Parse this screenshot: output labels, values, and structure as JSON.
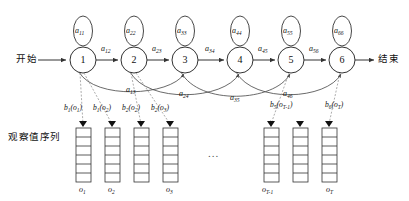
{
  "diagram": {
    "title_present": false,
    "start_label": "开始",
    "end_label": "结束",
    "observation_row_label": "观察值序列",
    "ellipsis": "...",
    "colors": {
      "stroke": "#333333",
      "dashed_stroke": "#8a8a8a",
      "text": "#111111",
      "background": "#ffffff"
    },
    "states": [
      {
        "id": "1",
        "label": "1",
        "cx": 83,
        "cy": 60,
        "r": 13,
        "self_loop": "a",
        "self_sub": "11"
      },
      {
        "id": "2",
        "label": "2",
        "cx": 134,
        "cy": 60,
        "r": 13,
        "self_loop": "a",
        "self_sub": "22"
      },
      {
        "id": "3",
        "label": "3",
        "cx": 185,
        "cy": 60,
        "r": 13,
        "self_loop": "a",
        "self_sub": "33"
      },
      {
        "id": "4",
        "label": "4",
        "cx": 240,
        "cy": 60,
        "r": 13,
        "self_loop": "a",
        "self_sub": "44"
      },
      {
        "id": "5",
        "label": "5",
        "cx": 291,
        "cy": 60,
        "r": 13,
        "self_loop": "a",
        "self_sub": "55"
      },
      {
        "id": "6",
        "label": "6",
        "cx": 342,
        "cy": 60,
        "r": 13,
        "self_loop": "a",
        "self_sub": "66"
      }
    ],
    "self_transitions": [
      {
        "base": "a",
        "sub": "11",
        "x": 74,
        "y": 17
      },
      {
        "base": "a",
        "sub": "22",
        "x": 125,
        "y": 17
      },
      {
        "base": "a",
        "sub": "33",
        "x": 176,
        "y": 17
      },
      {
        "base": "a",
        "sub": "44",
        "x": 231,
        "y": 17
      },
      {
        "base": "a",
        "sub": "55",
        "x": 282,
        "y": 17
      },
      {
        "base": "a",
        "sub": "66",
        "x": 333,
        "y": 17
      }
    ],
    "forward_transitions": [
      {
        "base": "a",
        "sub": "12",
        "x": 103,
        "y": 45
      },
      {
        "base": "a",
        "sub": "23",
        "x": 154,
        "y": 45
      },
      {
        "base": "a",
        "sub": "34",
        "x": 206,
        "y": 45
      },
      {
        "base": "a",
        "sub": "45",
        "x": 260,
        "y": 45
      },
      {
        "base": "a",
        "sub": "56",
        "x": 311,
        "y": 45
      }
    ],
    "skip_transitions": [
      {
        "base": "a",
        "sub": "13",
        "x": 128,
        "y": 88
      },
      {
        "base": "a",
        "sub": "24",
        "x": 181,
        "y": 92
      },
      {
        "base": "a",
        "sub": "35",
        "x": 232,
        "y": 96
      },
      {
        "base": "a",
        "sub": "46",
        "x": 285,
        "y": 92
      }
    ],
    "emissions": [
      {
        "base": "b",
        "state_sub": "1",
        "obs": "o",
        "obs_sub": "1",
        "x": 66,
        "y": 105
      },
      {
        "base": "b",
        "state_sub": "1",
        "obs": "o",
        "obs_sub": "2",
        "x": 95,
        "y": 105
      },
      {
        "base": "b",
        "state_sub": "2",
        "obs": "o",
        "obs_sub": "2",
        "x": 124,
        "y": 105
      },
      {
        "base": "b",
        "state_sub": "2",
        "obs": "o",
        "obs_sub": "3",
        "x": 153,
        "y": 105
      },
      {
        "base": "b",
        "state_sub": "5",
        "obs": "o",
        "obs_sub": "T-1",
        "x": 275,
        "y": 102
      },
      {
        "base": "b",
        "state_sub": "6",
        "obs": "o",
        "obs_sub": "T",
        "x": 330,
        "y": 102
      }
    ],
    "observation_columns": [
      {
        "x": 76,
        "y": 128,
        "w": 15,
        "h": 54,
        "cells": 6,
        "label_base": "o",
        "label_sub": "1",
        "label_x": 79,
        "label_y": 186
      },
      {
        "x": 105,
        "y": 128,
        "w": 15,
        "h": 54,
        "cells": 6,
        "label_base": "o",
        "label_sub": "2",
        "label_x": 108,
        "label_y": 186
      },
      {
        "x": 134,
        "y": 128,
        "w": 15,
        "h": 54,
        "cells": 6,
        "label_base": "o",
        "label_sub": "",
        "label_x": 0,
        "label_y": 0
      },
      {
        "x": 163,
        "y": 128,
        "w": 15,
        "h": 54,
        "cells": 6,
        "label_base": "o",
        "label_sub": "3",
        "label_x": 166,
        "label_y": 186
      },
      {
        "x": 264,
        "y": 128,
        "w": 15,
        "h": 54,
        "cells": 6,
        "label_base": "o",
        "label_sub": "T-1",
        "label_x": 264,
        "label_y": 186
      },
      {
        "x": 293,
        "y": 128,
        "w": 15,
        "h": 54,
        "cells": 6,
        "label_base": "o",
        "label_sub": "",
        "label_x": 0,
        "label_y": 0
      },
      {
        "x": 322,
        "y": 128,
        "w": 15,
        "h": 54,
        "cells": 6,
        "label_base": "o",
        "label_sub": "T",
        "label_x": 327,
        "label_y": 186
      }
    ],
    "ellipsis_pos": {
      "x": 213,
      "y": 152
    },
    "start_pos": {
      "x": 16,
      "y": 55
    },
    "end_pos": {
      "x": 378,
      "y": 55
    },
    "row_label_pos": {
      "x": 8,
      "y": 133
    }
  }
}
